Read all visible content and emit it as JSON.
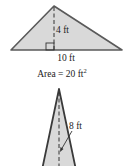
{
  "figure1": {
    "shape": "triangle",
    "height_label": "4 ft",
    "base_label": "10 ft",
    "area_label_prefix": "Area = 20 ft",
    "area_label_exponent": "2",
    "right_angle_marker": true
  },
  "figure2": {
    "shape": "triangle",
    "height_label": "8 ft"
  },
  "colors": {
    "fill": "#d9d9d9",
    "stroke": "#5a5a5a",
    "text": "#222222",
    "background": "#ffffff"
  }
}
